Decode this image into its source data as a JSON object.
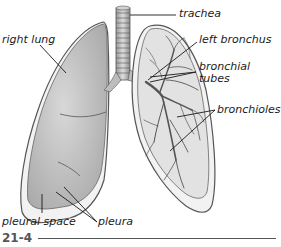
{
  "figure": {
    "number": "21-4"
  },
  "labels": {
    "trachea": "trachea",
    "left_bronchus": "left bronchus",
    "bronchial_tubes_line1": "bronchial",
    "bronchial_tubes_line2": "tubes",
    "bronchioles": "bronchioles",
    "right_lung": "right lung",
    "pleural_space": "pleural space",
    "pleura": "pleura"
  },
  "colors": {
    "lung_fill": "#c8c8c8",
    "lung_outline": "#555555",
    "pleura_fill": "#f2f2f2",
    "leader_line": "#1a1a1a",
    "label_text": "#1a1a1a",
    "figure_number": "#555555"
  }
}
